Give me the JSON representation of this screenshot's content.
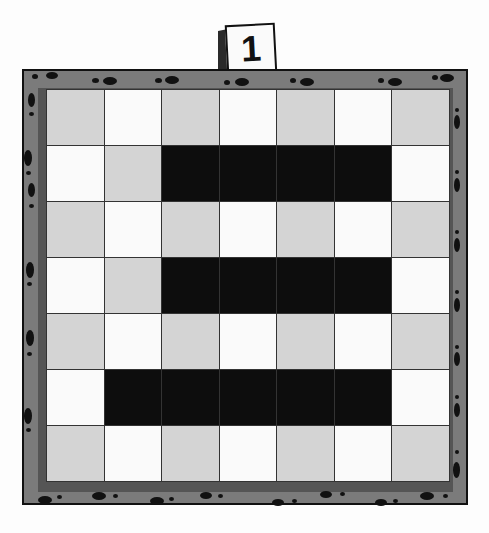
{
  "puzzle": {
    "number_label": "1",
    "rows": 7,
    "cols": 7,
    "cells": [
      [
        "gray",
        "white",
        "gray",
        "white",
        "gray",
        "white",
        "gray"
      ],
      [
        "white",
        "gray",
        "black",
        "black",
        "black",
        "black",
        "white"
      ],
      [
        "gray",
        "white",
        "gray",
        "white",
        "gray",
        "white",
        "gray"
      ],
      [
        "white",
        "gray",
        "black",
        "black",
        "black",
        "black",
        "white"
      ],
      [
        "gray",
        "white",
        "gray",
        "white",
        "gray",
        "white",
        "gray"
      ],
      [
        "white",
        "black",
        "black",
        "black",
        "black",
        "black",
        "white"
      ],
      [
        "gray",
        "white",
        "gray",
        "white",
        "gray",
        "white",
        "gray"
      ]
    ]
  },
  "colors": {
    "frame": "#7b7b7b",
    "gray_cell": "#d4d4d4",
    "white_cell": "#fafafa",
    "black_cell": "#0d0d0d"
  }
}
